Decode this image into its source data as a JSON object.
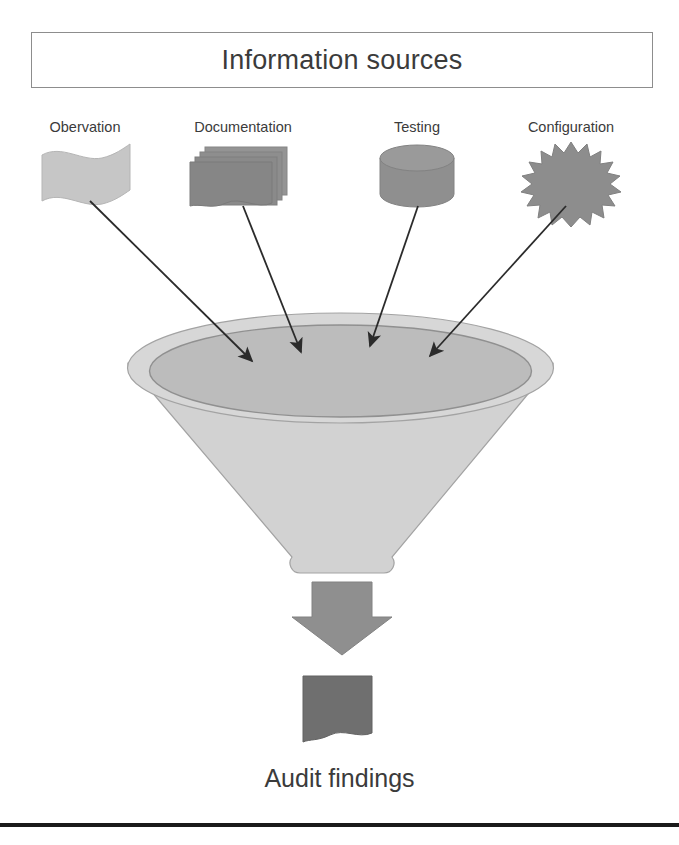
{
  "header": {
    "title": "Information sources"
  },
  "sources": [
    {
      "label": "Obervation",
      "icon": "flag-banner-icon",
      "label_x": 85,
      "color": "#c3c3c3"
    },
    {
      "label": "Documentation",
      "icon": "document-stack-icon",
      "label_x": 243,
      "color": "#8f8f8f"
    },
    {
      "label": "Testing",
      "icon": "database-cylinder-icon",
      "label_x": 417,
      "color": "#8f8f8f"
    },
    {
      "label": "Configuration",
      "icon": "starburst-icon",
      "label_x": 571,
      "color": "#8f8f8f"
    }
  ],
  "funnel": {
    "name": "funnel-shape",
    "outer_fill": "#d5d5d5",
    "inner_fill": "#bcbcbc",
    "body_fill": "#d2d2d2",
    "stroke": "#8f8f8f"
  },
  "flow_arrows": {
    "name": "source-to-funnel-arrows",
    "count": 4,
    "color": "#2b2b2b",
    "paths": [
      {
        "x1": 90,
        "y1": 201,
        "x2": 252,
        "y2": 361
      },
      {
        "x1": 243,
        "y1": 206,
        "x2": 301,
        "y2": 352
      },
      {
        "x1": 418,
        "y1": 206,
        "x2": 370,
        "y2": 346
      },
      {
        "x1": 566,
        "y1": 206,
        "x2": 430,
        "y2": 356
      }
    ]
  },
  "output": {
    "down_arrow_name": "funnel-output-arrow",
    "down_arrow_color": "#8f8f8f",
    "document_name": "audit-findings-document-icon",
    "document_color": "#6f6f6f",
    "caption": "Audit findings"
  },
  "footer": {
    "rule_color": "#1a1a1a"
  }
}
